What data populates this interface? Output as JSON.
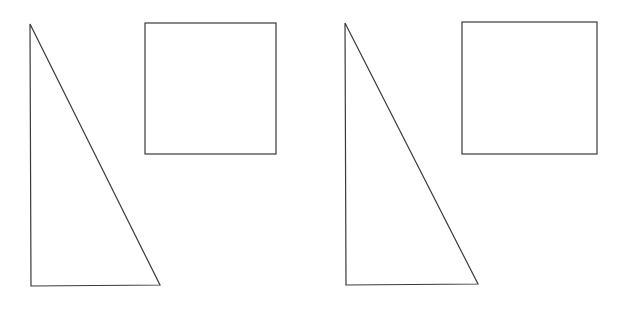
{
  "canvas": {
    "width": 626,
    "height": 310,
    "background": "#ffffff",
    "stroke": "#3a3a3a"
  },
  "figures": [
    {
      "name": "left-figure",
      "triangle": {
        "points": "30,24 31,286 160,285"
      },
      "square": {
        "x": 145,
        "y": 23,
        "width": 131,
        "height": 131
      }
    },
    {
      "name": "right-figure",
      "triangle": {
        "points": "345,23 346,285 478,284"
      },
      "square": {
        "x": 462,
        "y": 22,
        "width": 135,
        "height": 132
      }
    }
  ]
}
